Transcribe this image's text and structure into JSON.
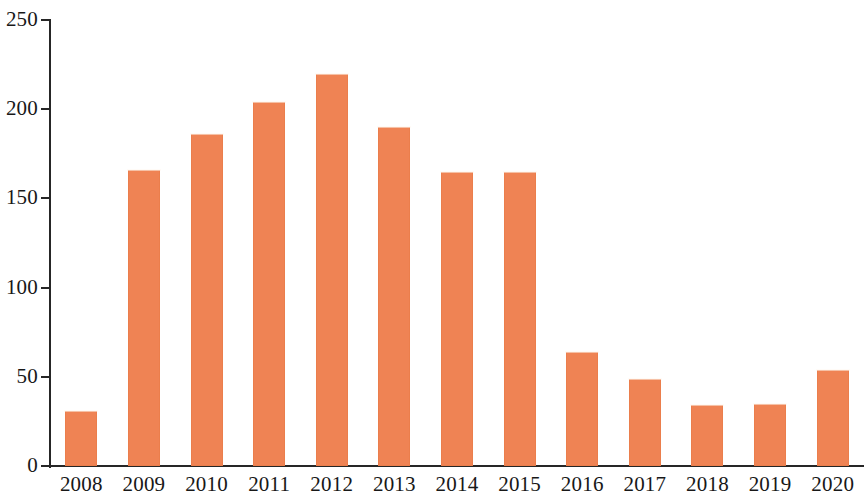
{
  "chart_data": {
    "type": "bar",
    "title": "",
    "subtitle": "",
    "xlabel": "",
    "ylabel": "",
    "categories": [
      "2008",
      "2009",
      "2010",
      "2011",
      "2012",
      "2013",
      "2014",
      "2015",
      "2016",
      "2017",
      "2018",
      "2019",
      "2020"
    ],
    "values": [
      31,
      166,
      186,
      204,
      220,
      190,
      165,
      165,
      64,
      49,
      34,
      35,
      54
    ],
    "series": [
      {
        "name": "",
        "values": [
          31,
          166,
          186,
          204,
          220,
          190,
          165,
          165,
          64,
          49,
          34,
          35,
          54
        ]
      }
    ],
    "ylim": [
      0,
      250
    ],
    "ytick_labels": [
      "0",
      "50",
      "100",
      "150",
      "200",
      "250"
    ],
    "ytick_values": [
      0,
      50,
      100,
      150,
      200,
      250
    ],
    "grid": false,
    "legend": null,
    "legend_position": "none",
    "annotations": [],
    "bar_color": "#ef8354",
    "axis_color": "#262626",
    "background_color": "#ffffff"
  }
}
